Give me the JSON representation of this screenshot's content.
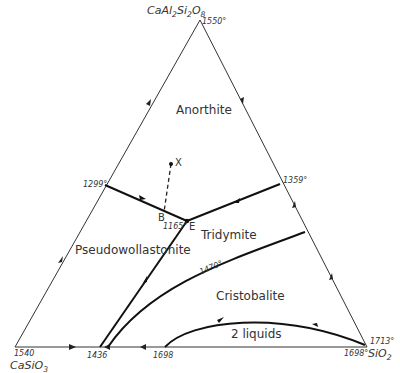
{
  "diagram": {
    "type": "ternary-phase-diagram",
    "components": {
      "top": {
        "formula_html": "CaAl<sub>2</sub>Si<sub>2</sub>O<sub>8</sub>",
        "formula": "CaAl2Si2O8",
        "melting_point": "1550°"
      },
      "bottom_left": {
        "formula_html": "CaSiO<sub>3</sub>",
        "formula": "CaSiO3",
        "melting_point": "1540"
      },
      "bottom_right": {
        "formula_html": "SiO<sub>2</sub>",
        "formula": "SiO2",
        "melting_points": [
          "1713°",
          "1698°"
        ]
      }
    },
    "phase_fields": [
      {
        "name": "Anorthite"
      },
      {
        "name": "Pseudowollastonite"
      },
      {
        "name": "Tridymite"
      },
      {
        "name": "Cristobalite"
      },
      {
        "name": "2 liquids"
      }
    ],
    "points": {
      "X": "X",
      "B": "B",
      "E": "E",
      "eutectic_temp": "1165°"
    },
    "temperatures": {
      "left_edge_binary": "1299°",
      "right_edge_binary": "1359°",
      "isotherm": "1470°",
      "bottom_1436": "1436",
      "bottom_1698": "1698"
    }
  }
}
